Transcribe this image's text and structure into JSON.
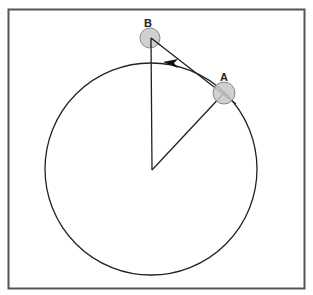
{
  "diagram": {
    "labels": {
      "point_a": "A",
      "point_b": "B"
    },
    "colors": {
      "frame": "#555555",
      "stroke": "#222222",
      "ball_fill": "#c8c8c8",
      "ball_stroke": "#888888"
    },
    "circle": {
      "cx": 151,
      "cy": 169,
      "r": 106
    },
    "center": {
      "x": 152,
      "y": 170
    },
    "point_a": {
      "x": 224,
      "y": 93,
      "r": 11
    },
    "point_b": {
      "x": 150,
      "y": 38,
      "r": 10
    }
  }
}
